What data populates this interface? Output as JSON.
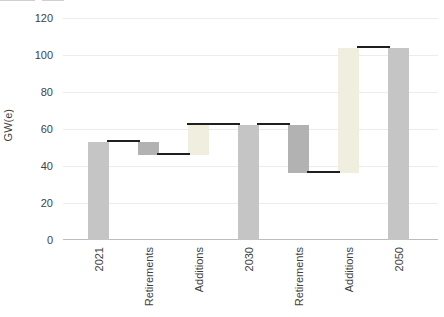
{
  "chart_data": {
    "type": "bar",
    "subtype": "waterfall",
    "title": "",
    "xlabel": "",
    "ylabel": "GW(e)",
    "ylim": [
      0,
      120
    ],
    "yticks": [
      0,
      20,
      40,
      60,
      80,
      100,
      120
    ],
    "grid": "horizontal-light",
    "legend": "none",
    "categories": [
      "2021",
      "Retirements",
      "Additions",
      "2030",
      "Retirements",
      "Additions",
      "2050"
    ],
    "bars": [
      {
        "category": "2021",
        "role": "total",
        "from": 0,
        "to": 53
      },
      {
        "category": "Retirements",
        "role": "decrease",
        "from": 46,
        "to": 53
      },
      {
        "category": "Additions",
        "role": "increase",
        "from": 46,
        "to": 62
      },
      {
        "category": "2030",
        "role": "total",
        "from": 0,
        "to": 62
      },
      {
        "category": "Retirements",
        "role": "decrease",
        "from": 36,
        "to": 62
      },
      {
        "category": "Additions",
        "role": "increase",
        "from": 36,
        "to": 104
      },
      {
        "category": "2050",
        "role": "total",
        "from": 0,
        "to": 104
      }
    ],
    "connectors": [
      {
        "from_bar": 0,
        "to_bar": 1,
        "value": 53,
        "start_edge": "right"
      },
      {
        "from_bar": 1,
        "to_bar": 2,
        "value": 46,
        "start_edge": "right"
      },
      {
        "from_bar": 2,
        "to_bar": 3,
        "value": 62,
        "start_edge": "left"
      },
      {
        "from_bar": 3,
        "to_bar": 4,
        "value": 62,
        "start_edge": "right"
      },
      {
        "from_bar": 4,
        "to_bar": 5,
        "value": 36,
        "start_edge": "right"
      },
      {
        "from_bar": 5,
        "to_bar": 6,
        "value": 104,
        "start_edge": "right"
      }
    ],
    "colors": {
      "total": "#c5c5c5",
      "decrease": "#b2b2b2",
      "increase": "#f0efdf",
      "connector": "#1f1f1f",
      "gridline": "#ececec",
      "axis_line": "#bdbdbd",
      "text": "#3f3f3f"
    }
  }
}
